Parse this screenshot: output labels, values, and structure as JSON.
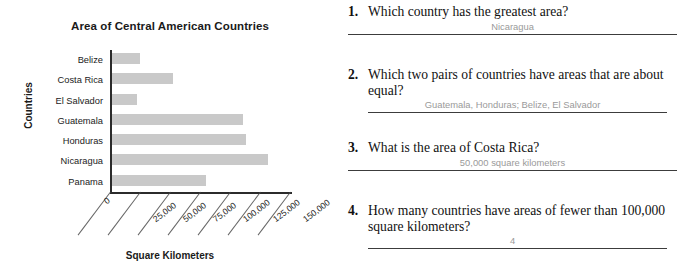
{
  "chart_data": {
    "type": "bar",
    "orientation": "horizontal",
    "title": "Area of Central American Countries",
    "xlabel": "Square Kilometers",
    "ylabel": "Countries",
    "categories": [
      "Belize",
      "Costa Rica",
      "El Salvador",
      "Guatemala",
      "Honduras",
      "Nicaragua",
      "Panama"
    ],
    "values": [
      23000,
      51000,
      21000,
      109000,
      112000,
      130000,
      78000
    ],
    "xlim": [
      0,
      150000
    ],
    "xticks": [
      0,
      25000,
      50000,
      75000,
      100000,
      125000,
      150000
    ],
    "xtick_labels": [
      "0",
      "25,000",
      "50,000",
      "75,000",
      "100,000",
      "125,000",
      "150,000"
    ],
    "grid": false,
    "legend": false,
    "bar_color": "#c9c9c9",
    "axis_color": "#2b2b2b"
  },
  "questions": [
    {
      "number": "1.",
      "text": "Which country has the greatest area?",
      "answer": "Nicaragua",
      "indent": false
    },
    {
      "number": "2.",
      "text": "Which two pairs of countries have areas that are about equal?",
      "answer": "Guatemala, Honduras; Belize, El Salvador",
      "indent": true
    },
    {
      "number": "3.",
      "text": "What is the area of Costa Rica?",
      "answer": "50,000 square kilometers",
      "indent": false
    },
    {
      "number": "4.",
      "text": "How many countries have areas of fewer than 100,000 square kilometers?",
      "answer": "4",
      "indent": true
    }
  ]
}
